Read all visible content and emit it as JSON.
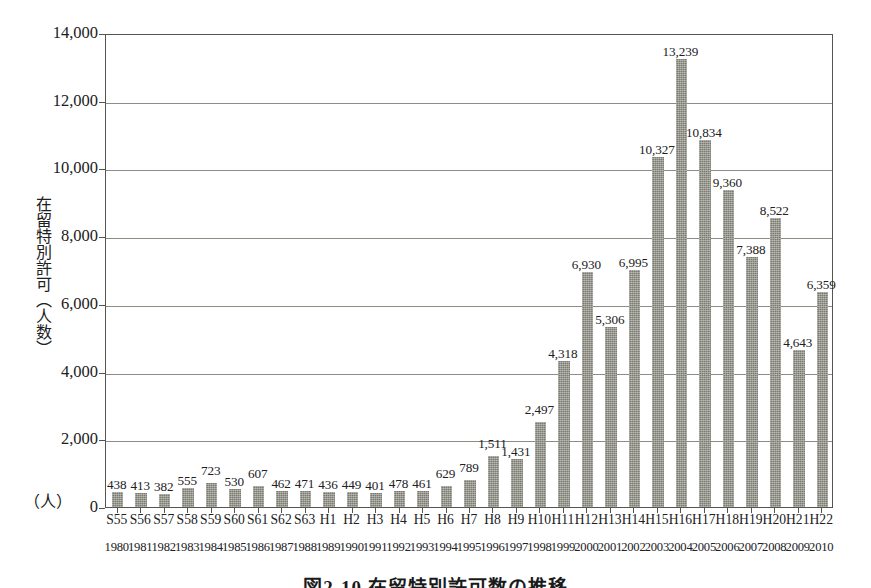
{
  "chart_data": {
    "type": "bar",
    "title": "図2-10 在留特別許可数の推移",
    "xlabel": "",
    "ylabel": "在留特別許可（人数）",
    "y_unit": "（人）",
    "ylim": [
      0,
      14000
    ],
    "ytick_step": 2000,
    "yticks": [
      "0",
      "2,000",
      "4,000",
      "6,000",
      "8,000",
      "10,000",
      "12,000",
      "14,000"
    ],
    "ytick_values": [
      0,
      2000,
      4000,
      6000,
      8000,
      10000,
      12000,
      14000
    ],
    "grid": true,
    "legend": "none",
    "bar_color": "#7b7b72",
    "categories": [
      "S55",
      "S56",
      "S57",
      "S58",
      "S59",
      "S60",
      "S61",
      "S62",
      "S63",
      "H1",
      "H2",
      "H3",
      "H4",
      "H5",
      "H6",
      "H7",
      "H8",
      "H9",
      "H10",
      "H11",
      "H12",
      "H13",
      "H14",
      "H15",
      "H16",
      "H17",
      "H18",
      "H19",
      "H20",
      "H21",
      "H22"
    ],
    "categories_secondary": [
      "1980",
      "1981",
      "1982",
      "1983",
      "1984",
      "1985",
      "1986",
      "1987",
      "1988",
      "1989",
      "1990",
      "1991",
      "1992",
      "1993",
      "1994",
      "1995",
      "1996",
      "1997",
      "1998",
      "1999",
      "2000",
      "2001",
      "2002",
      "2003",
      "2004",
      "2005",
      "2006",
      "2007",
      "2008",
      "2009",
      "2010"
    ],
    "values": [
      438,
      413,
      382,
      555,
      723,
      530,
      607,
      462,
      471,
      436,
      449,
      401,
      478,
      461,
      629,
      789,
      1511,
      1431,
      2497,
      4318,
      6930,
      5306,
      6995,
      10327,
      13239,
      10834,
      9360,
      7388,
      8522,
      4643,
      6359
    ],
    "value_labels": [
      "438",
      "413",
      "382",
      "555",
      "723",
      "530",
      "607",
      "462",
      "471",
      "436",
      "449",
      "401",
      "478",
      "461",
      "629",
      "789",
      "1,511",
      "1,431",
      "2,497",
      "4,318",
      "6,930",
      "5,306",
      "6,995",
      "10,327",
      "13,239",
      "10,834",
      "9,360",
      "7,388",
      "8,522",
      "4,643",
      "6,359"
    ]
  },
  "caption": {
    "text": "図2-10 在留特別許可数の推移"
  }
}
